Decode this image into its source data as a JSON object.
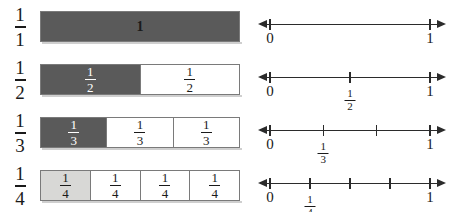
{
  "diagram": {
    "colors": {
      "fill_dark": "#5a5a5a",
      "fill_light": "#d8d8d6",
      "fill_none": "#ffffff",
      "border": "#7a7a7a",
      "axis": "#2b2b2b",
      "text": "#1a1a1a"
    },
    "rows": [
      {
        "row_label": {
          "numerator": "1",
          "denominator": "1"
        },
        "bar": {
          "denominator": 1,
          "cells": [
            {
              "text": "1",
              "style": "whole",
              "fill": "dark"
            }
          ]
        },
        "number_line": {
          "left_arrow": true,
          "right_arrow": true,
          "ticks": [
            {
              "position": 0,
              "label_type": "int",
              "label": "0"
            },
            {
              "position": 1,
              "label_type": "int",
              "label": "1"
            }
          ]
        }
      },
      {
        "row_label": {
          "numerator": "1",
          "denominator": "2"
        },
        "bar": {
          "denominator": 2,
          "cells": [
            {
              "numerator": "1",
              "denominator": "2",
              "style": "fraction",
              "fill": "dark"
            },
            {
              "numerator": "1",
              "denominator": "2",
              "style": "fraction",
              "fill": "none"
            }
          ]
        },
        "number_line": {
          "left_arrow": true,
          "right_arrow": true,
          "ticks": [
            {
              "position": 0,
              "label_type": "int",
              "label": "0"
            },
            {
              "position": 0.5,
              "label_type": "fraction",
              "numerator": "1",
              "denominator": "2"
            },
            {
              "position": 1,
              "label_type": "int",
              "label": "1"
            }
          ]
        }
      },
      {
        "row_label": {
          "numerator": "1",
          "denominator": "3"
        },
        "bar": {
          "denominator": 3,
          "cells": [
            {
              "numerator": "1",
              "denominator": "3",
              "style": "fraction",
              "fill": "dark"
            },
            {
              "numerator": "1",
              "denominator": "3",
              "style": "fraction",
              "fill": "none"
            },
            {
              "numerator": "1",
              "denominator": "3",
              "style": "fraction",
              "fill": "none"
            }
          ]
        },
        "number_line": {
          "left_arrow": true,
          "right_arrow": true,
          "ticks": [
            {
              "position": 0,
              "label_type": "int",
              "label": "0"
            },
            {
              "position": 0.3333,
              "label_type": "fraction",
              "numerator": "1",
              "denominator": "3"
            },
            {
              "position": 0.6667,
              "label_type": "none"
            },
            {
              "position": 1,
              "label_type": "int",
              "label": "1"
            }
          ]
        }
      },
      {
        "row_label": {
          "numerator": "1",
          "denominator": "4"
        },
        "bar": {
          "denominator": 4,
          "cells": [
            {
              "numerator": "1",
              "denominator": "4",
              "style": "fraction",
              "fill": "light"
            },
            {
              "numerator": "1",
              "denominator": "4",
              "style": "fraction",
              "fill": "none"
            },
            {
              "numerator": "1",
              "denominator": "4",
              "style": "fraction",
              "fill": "none"
            },
            {
              "numerator": "1",
              "denominator": "4",
              "style": "fraction",
              "fill": "none"
            }
          ]
        },
        "number_line": {
          "left_arrow": true,
          "right_arrow": true,
          "ticks": [
            {
              "position": 0,
              "label_type": "int",
              "label": "0"
            },
            {
              "position": 0.25,
              "label_type": "fraction",
              "numerator": "1",
              "denominator": "4"
            },
            {
              "position": 0.5,
              "label_type": "none"
            },
            {
              "position": 0.75,
              "label_type": "none"
            },
            {
              "position": 1,
              "label_type": "int",
              "label": "1"
            }
          ]
        }
      }
    ]
  }
}
